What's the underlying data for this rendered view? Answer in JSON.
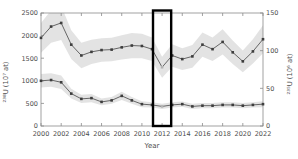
{
  "figure": {
    "background": "#ffffff",
    "width": 298,
    "height": 159
  },
  "chart_data": {
    "type": "line",
    "title": "",
    "xlabel": "Year",
    "x": [
      2000,
      2001,
      2002,
      2003,
      2004,
      2005,
      2006,
      2007,
      2008,
      2009,
      2010,
      2011,
      2012,
      2013,
      2014,
      2015,
      2016,
      2017,
      2018,
      2019,
      2020,
      2021,
      2022
    ],
    "xlim": [
      2000,
      2022
    ],
    "xticks": [
      2000,
      2002,
      2004,
      2006,
      2008,
      2010,
      2012,
      2014,
      2016,
      2018,
      2020,
      2022
    ],
    "axes": {
      "left": {
        "label": "²³⁸U (10⁷ at)",
        "lim": [
          0,
          2500
        ],
        "ticks": [
          0,
          500,
          1000,
          1500,
          2000,
          2500
        ]
      },
      "right": {
        "label": "²³⁵U (10⁶ at)",
        "lim": [
          0,
          150
        ],
        "ticks": [
          0,
          50,
          100,
          150
        ]
      }
    },
    "series": [
      {
        "name": "238U",
        "axis": "left",
        "values": [
          1950,
          2200,
          2280,
          1800,
          1560,
          1640,
          1680,
          1690,
          1740,
          1780,
          1770,
          1700,
          1300,
          1560,
          1480,
          1540,
          1800,
          1700,
          1860,
          1630,
          1430,
          1650,
          1920
        ],
        "band_halfwidth": [
          330,
          360,
          380,
          320,
          280,
          270,
          260,
          260,
          270,
          280,
          270,
          260,
          230,
          250,
          240,
          250,
          270,
          260,
          280,
          260,
          240,
          270,
          310
        ]
      },
      {
        "name": "235U",
        "axis": "right",
        "values": [
          60,
          61,
          58,
          43,
          36,
          37,
          32,
          34,
          40,
          34,
          29,
          28,
          26,
          28,
          29,
          26,
          27,
          27,
          28,
          28,
          27,
          28,
          29
        ],
        "band_halfwidth": [
          9,
          9,
          9,
          6.5,
          5.5,
          5.5,
          4.5,
          4.5,
          5.5,
          4.5,
          4,
          3.5,
          3.5,
          3.5,
          3.5,
          3.5,
          3.5,
          3.5,
          3.5,
          3.5,
          3.5,
          3.5,
          4
        ]
      }
    ],
    "highlight": {
      "shape": "rect",
      "year_range": [
        2011.1,
        2012.9
      ],
      "stroke": "#000000",
      "linewidth": 2.4,
      "marker_year": 2012,
      "marker_color": "#b3b3b3"
    },
    "grid": false,
    "legend": null,
    "style": {
      "line_color": "#666666",
      "marker_color": "#3d3d3d",
      "band_color": "#d9d9d9",
      "band_opacity": 0.75,
      "spine_color": "#8a8a8a",
      "tick_label_color": "#4d4d4d",
      "axis_label_color": "#4d4d4d"
    }
  }
}
